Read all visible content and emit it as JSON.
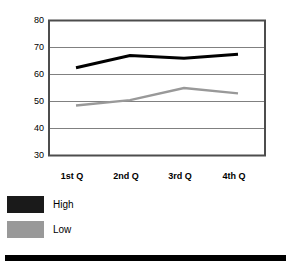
{
  "chart_data": {
    "type": "line",
    "title": "",
    "xlabel": "",
    "ylabel": "",
    "categories": [
      "1st Q",
      "2nd Q",
      "3rd Q",
      "4th Q"
    ],
    "series": [
      {
        "name": "High",
        "color": "#000000",
        "values": [
          62.5,
          67.0,
          66.0,
          67.5
        ]
      },
      {
        "name": "Low",
        "color": "#999999",
        "values": [
          48.5,
          50.5,
          55.0,
          53.0
        ]
      }
    ],
    "ylim": [
      30,
      80
    ],
    "yticks": [
      80,
      70,
      60,
      50,
      40,
      30
    ],
    "ytick_labels": [
      "80",
      "70",
      "60",
      "50",
      "40",
      "30"
    ],
    "grid": true,
    "grid_axis": "y",
    "legend_position": "bottom-left",
    "plot_border": true
  },
  "legend": {
    "items": [
      {
        "label": "High",
        "color": "#1a1a1a"
      },
      {
        "label": "Low",
        "color": "#999999"
      }
    ]
  },
  "footer": {
    "bar_color": "#000000"
  },
  "colors": {
    "high_series": "#000000",
    "low_series": "#999999",
    "axis": "#4d4d4d",
    "grid": "#808080",
    "background": "#ffffff"
  }
}
